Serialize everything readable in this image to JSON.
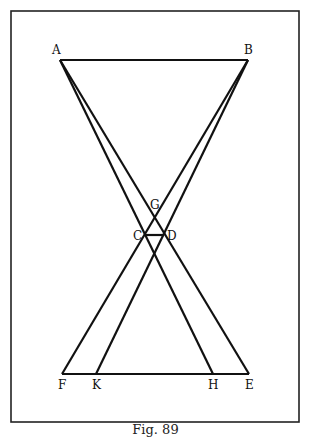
{
  "figure": {
    "caption": "Fig. 89",
    "points": {
      "A": {
        "label": "A",
        "x": 60,
        "y": 60
      },
      "B": {
        "label": "B",
        "x": 248,
        "y": 60
      },
      "C": {
        "label": "C",
        "x": 146,
        "y": 235
      },
      "D": {
        "label": "D",
        "x": 164,
        "y": 235
      },
      "G": {
        "label": "G",
        "x": 155,
        "y": 218
      },
      "F": {
        "label": "F",
        "x": 62,
        "y": 374
      },
      "K": {
        "label": "K",
        "x": 96,
        "y": 374
      },
      "H": {
        "label": "H",
        "x": 213,
        "y": 374
      },
      "E": {
        "label": "E",
        "x": 249,
        "y": 374
      }
    },
    "segments": [
      [
        "A",
        "B"
      ],
      [
        "F",
        "E"
      ],
      [
        "A",
        "E"
      ],
      [
        "A",
        "H"
      ],
      [
        "B",
        "F"
      ],
      [
        "B",
        "K"
      ],
      [
        "C",
        "D"
      ]
    ],
    "line_color": "#111111",
    "frame_color": "#222222"
  }
}
